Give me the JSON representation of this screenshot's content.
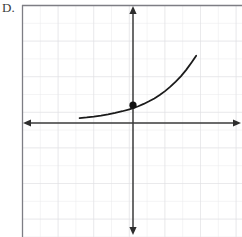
{
  "figure": {
    "choice_label": "D.",
    "caption": "Graph of an increasing exponential function with a marked y-intercept point",
    "colors": {
      "background": "#ffffff",
      "grid_minor": "#e9e9ec",
      "grid_major": "#dcdce1",
      "plot_border": "#808086",
      "axis": "#3a3a3a",
      "curve": "#1b1b1b",
      "point": "#111111",
      "label_text": "#3b3b3b"
    },
    "plot_area": {
      "left_px": 22,
      "top_px": 5,
      "right_px": 242,
      "bottom_px": 237,
      "cell_size_px": 17.8,
      "columns": 12,
      "rows": 13,
      "grid_visible": true
    },
    "axes": {
      "x_axis": {
        "name": "x-axis",
        "y_px": 123,
        "from_px": 24,
        "to_px": 240,
        "arrow_left": true,
        "arrow_right": true,
        "tick_labels": [],
        "label": ""
      },
      "y_axis": {
        "name": "y-axis",
        "x_px": 133,
        "from_px": 6,
        "to_px": 234,
        "arrow_up": true,
        "arrow_down": true,
        "tick_labels": [],
        "label": ""
      }
    }
  },
  "chart_data": {
    "type": "line",
    "title": "",
    "subtitle": "",
    "xlabel": "",
    "ylabel": "",
    "xlim": [
      -6.1,
      6.0
    ],
    "ylim": [
      -6.2,
      6.6
    ],
    "grid": true,
    "legend": null,
    "legend_position": "none",
    "axis_arrows": [
      "left",
      "right",
      "up",
      "down"
    ],
    "series": [
      {
        "name": "exponential curve",
        "equation_form": "y = a*b^x, b > 1",
        "style": "solid",
        "color": "#1b1b1b",
        "width_px": 1.8,
        "x": [
          -3.0,
          -2.6,
          -2.2,
          -1.8,
          -1.4,
          -1.0,
          -0.6,
          -0.2,
          0.0,
          0.3,
          0.6,
          0.9,
          1.2,
          1.5,
          1.8,
          2.1,
          2.4,
          2.7,
          3.0,
          3.3,
          3.55
        ],
        "y": [
          0.27,
          0.31,
          0.36,
          0.42,
          0.49,
          0.57,
          0.66,
          0.77,
          0.83,
          0.94,
          1.07,
          1.22,
          1.38,
          1.57,
          1.79,
          2.04,
          2.32,
          2.63,
          3.0,
          3.41,
          3.78
        ]
      }
    ],
    "points": [
      {
        "name": "y-intercept point",
        "x": 0,
        "y": 1,
        "marker": "filled-circle",
        "radius_px": 3.6,
        "color": "#111111",
        "label": ""
      }
    ],
    "annotations": [
      {
        "name": "choice-label",
        "text": "D.",
        "x_px": 3,
        "y_px": 2
      }
    ]
  }
}
